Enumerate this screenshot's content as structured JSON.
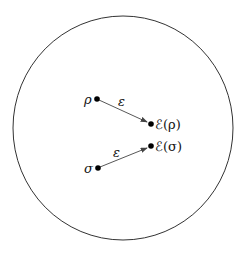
{
  "diagram": {
    "type": "quantum channel mapping on state space",
    "boundary": {
      "shape": "circle",
      "cx": 123,
      "cy": 128,
      "rx": 110,
      "ry": 112,
      "stroke": "#333333"
    },
    "points": [
      {
        "id": "rho",
        "label": "ρ",
        "x": 97,
        "y": 99
      },
      {
        "id": "E_rho",
        "label": "ℰ(ρ)",
        "x": 151,
        "y": 124
      },
      {
        "id": "sigma",
        "label": "σ",
        "x": 98,
        "y": 168
      },
      {
        "id": "E_sigma",
        "label": "ℰ(σ)",
        "x": 151,
        "y": 146
      }
    ],
    "arrows": [
      {
        "from": "rho",
        "to": "E_rho",
        "label": "ε"
      },
      {
        "from": "sigma",
        "to": "E_sigma",
        "label": "ε"
      }
    ]
  }
}
